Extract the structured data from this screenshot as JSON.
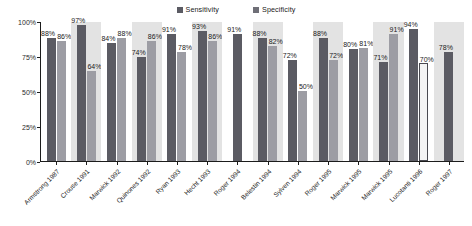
{
  "chart_data": {
    "type": "bar",
    "title": "",
    "xlabel": "",
    "ylabel": "",
    "ylim": [
      0,
      100
    ],
    "yticks": [
      "0%",
      "25%",
      "50%",
      "75%",
      "100%"
    ],
    "grid": false,
    "legend_position": "top-center",
    "categories": [
      "Armstrong 1987",
      "Crouse 1991",
      "Marwick 1992",
      "Quinones 1992",
      "Ryan 1993",
      "Hecht 1993",
      "Roger 1994",
      "Belestin 1994",
      "Sylven 1994",
      "Roger 1995",
      "Marwick 1995",
      "Marwick 1995",
      "Lucotanti 1996",
      "Roger 1997"
    ],
    "series": [
      {
        "name": "Sensitivity",
        "color": "#5b5b63",
        "values": [
          88,
          97,
          84,
          74,
          91,
          93,
          91,
          88,
          72,
          88,
          80,
          71,
          94,
          78
        ],
        "labels": [
          "88%",
          "97%",
          "84%",
          "74%",
          "91%",
          "93%",
          "91%",
          "88%",
          "72%",
          "88%",
          "80%",
          "71%",
          "94%",
          "78%"
        ]
      },
      {
        "name": "Specificity",
        "color": "#9d9da4",
        "values": [
          86,
          64,
          88,
          86,
          78,
          86,
          null,
          82,
          50,
          72,
          81,
          91,
          70,
          null
        ],
        "labels": [
          "86%",
          "64%",
          "88%",
          "86%",
          "78%",
          "86%",
          "",
          "82%",
          "50%",
          "72%",
          "81%",
          "91%",
          "70%",
          ""
        ]
      }
    ]
  },
  "legend": {
    "entries": [
      {
        "label": "Sensitivity"
      },
      {
        "label": "Specificity"
      }
    ]
  },
  "axis": {
    "y": {
      "ticks": [
        {
          "label": "100%",
          "value": 100
        },
        {
          "label": "75%",
          "value": 75
        },
        {
          "label": "50%",
          "value": 50
        },
        {
          "label": "25%",
          "value": 25
        },
        {
          "label": "0%",
          "value": 0
        }
      ]
    }
  }
}
